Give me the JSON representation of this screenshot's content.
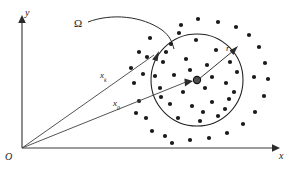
{
  "figure": {
    "kind": "vector-diagram",
    "background_color": "#ffffff",
    "ink_color": "#1a1a1a",
    "axis_color": "#3a3a3a"
  },
  "labels": {
    "origin": "O",
    "x_axis": "x",
    "y_axis": "y",
    "region": "Ω",
    "vector_upper_base": "x",
    "vector_upper_sub": "k",
    "vector_lower_base": "x",
    "vector_lower_sub": "0",
    "radius": "r"
  },
  "geometry": {
    "origin": {
      "x": 22,
      "y": 148
    },
    "x_axis_end": {
      "x": 276,
      "y": 148
    },
    "y_axis_end": {
      "x": 22,
      "y": 17
    },
    "circle": {
      "cx": 197,
      "cy": 80,
      "r": 46
    },
    "center_point": {
      "x": 197,
      "y": 80,
      "radius": 3.6
    },
    "vector_upper_tip": {
      "x": 158,
      "y": 52
    },
    "vector_lower_tip": {
      "x": 191,
      "y": 81
    },
    "radius_tip": {
      "x": 237,
      "y": 48
    },
    "radius_start": {
      "x": 199,
      "y": 79
    },
    "leader_start": {
      "x": 88,
      "y": 22
    },
    "leader_end": {
      "x": 174,
      "y": 49
    }
  },
  "points": {
    "count_inside": 29,
    "count_outside": 27,
    "dot_radius": 2.1,
    "inside": [
      [
        171,
        44
      ],
      [
        196,
        40
      ],
      [
        216,
        50
      ],
      [
        163,
        62
      ],
      [
        186,
        59
      ],
      [
        207,
        65
      ],
      [
        230,
        62
      ],
      [
        174,
        75
      ],
      [
        160,
        88
      ],
      [
        183,
        92
      ],
      [
        205,
        88
      ],
      [
        226,
        83
      ],
      [
        237,
        72
      ],
      [
        170,
        104
      ],
      [
        192,
        106
      ],
      [
        212,
        102
      ],
      [
        229,
        99
      ],
      [
        161,
        97
      ],
      [
        178,
        118
      ],
      [
        200,
        121
      ],
      [
        218,
        116
      ],
      [
        234,
        92
      ],
      [
        155,
        76
      ],
      [
        190,
        70
      ],
      [
        212,
        77
      ],
      [
        225,
        109
      ],
      [
        166,
        52
      ],
      [
        203,
        112
      ],
      [
        179,
        33
      ]
    ],
    "outside": [
      [
        150,
        38
      ],
      [
        139,
        52
      ],
      [
        131,
        68
      ],
      [
        134,
        83
      ],
      [
        139,
        101
      ],
      [
        146,
        118
      ],
      [
        152,
        131
      ],
      [
        165,
        136
      ],
      [
        147,
        57
      ],
      [
        143,
        74
      ],
      [
        136,
        113
      ],
      [
        181,
        25
      ],
      [
        198,
        19
      ],
      [
        218,
        22
      ],
      [
        236,
        27
      ],
      [
        249,
        35
      ],
      [
        259,
        47
      ],
      [
        265,
        63
      ],
      [
        268,
        79
      ],
      [
        264,
        96
      ],
      [
        255,
        112
      ],
      [
        243,
        124
      ],
      [
        227,
        133
      ],
      [
        209,
        138
      ],
      [
        190,
        140
      ],
      [
        172,
        143
      ],
      [
        254,
        77
      ]
    ]
  }
}
